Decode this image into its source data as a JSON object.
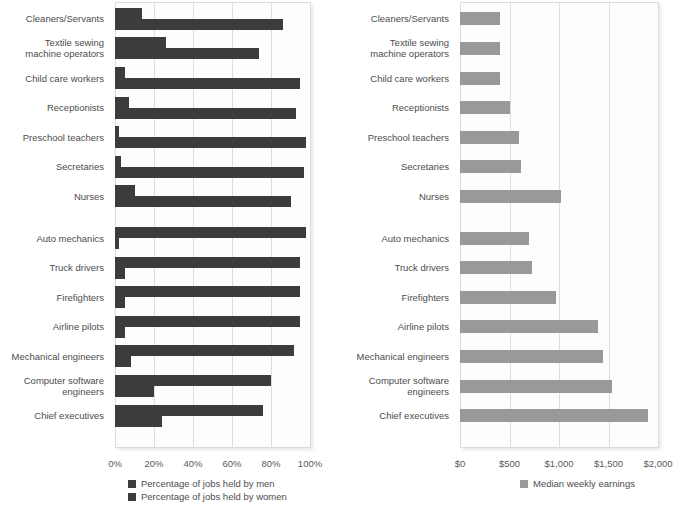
{
  "chart_data": [
    {
      "type": "bar",
      "orientation": "horizontal",
      "title": "",
      "xlabel": "",
      "ylabel": "",
      "xlim": [
        0,
        100
      ],
      "grid": true,
      "legend_position": "bottom",
      "tick_labels": [
        "0%",
        "20%",
        "40%",
        "60%",
        "80%",
        "100%"
      ],
      "tick_values": [
        0,
        20,
        40,
        60,
        80,
        100
      ],
      "categories": [
        "Cleaners/Servants",
        "Textile sewing\nmachine operators",
        "Child care workers",
        "Receptionists",
        "Preschool teachers",
        "Secretaries",
        "Nurses",
        "Auto mechanics",
        "Truck drivers",
        "Firefighters",
        "Airline pilots",
        "Mechanical engineers",
        "Computer software\nengineers",
        "Chief executives"
      ],
      "series": [
        {
          "name": "Percentage of jobs held by men",
          "color": "#3c3c3c",
          "values": [
            14,
            26,
            5,
            7,
            2,
            3,
            10,
            98,
            95,
            95,
            95,
            92,
            80,
            76
          ]
        },
        {
          "name": "Percentage of jobs held by women",
          "color": "#3c3c3c",
          "values": [
            86,
            74,
            95,
            93,
            98,
            97,
            90,
            2,
            5,
            5,
            5,
            8,
            20,
            24
          ]
        }
      ],
      "group_gap_after_index": 6
    },
    {
      "type": "bar",
      "orientation": "horizontal",
      "title": "",
      "xlabel": "",
      "ylabel": "",
      "xlim": [
        0,
        2000
      ],
      "grid": true,
      "legend_position": "bottom",
      "tick_labels": [
        "$0",
        "$500",
        "$1,000",
        "$1,500",
        "$2,000"
      ],
      "tick_values": [
        0,
        500,
        1000,
        1500,
        2000
      ],
      "categories": [
        "Cleaners/Servants",
        "Textile sewing\nmachine operators",
        "Child care workers",
        "Receptionists",
        "Preschool teachers",
        "Secretaries",
        "Nurses",
        "Auto mechanics",
        "Truck drivers",
        "Firefighters",
        "Airline pilots",
        "Mechanical engineers",
        "Computer software\nengineers",
        "Chief executives"
      ],
      "series": [
        {
          "name": "Median weekly earnings",
          "color": "#999999",
          "values": [
            400,
            400,
            400,
            500,
            600,
            620,
            1020,
            700,
            730,
            970,
            1390,
            1440,
            1540,
            1900
          ]
        }
      ],
      "group_gap_after_index": 6
    }
  ],
  "left_chart": {
    "legend": {
      "men_label": "Percentage of jobs held by men",
      "women_label": "Percentage of jobs held by women"
    }
  },
  "right_chart": {
    "legend": {
      "earnings_label": "Median weekly earnings"
    }
  }
}
